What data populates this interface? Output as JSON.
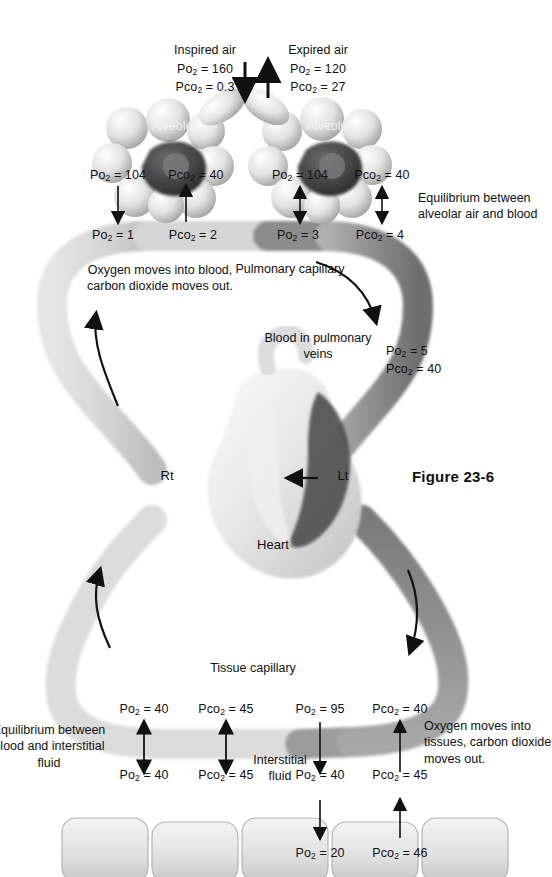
{
  "figure": {
    "caption": "Figure 23-6"
  },
  "air": {
    "inspired": {
      "label": "Inspired air",
      "po2": "Po2 = 160",
      "pco2": "Pco2 = 0.3"
    },
    "expired": {
      "label": "Expired air",
      "po2": "Po2 = 120",
      "pco2": "Pco2 = 27"
    }
  },
  "alveoli": {
    "left": {
      "name": "Alveolus",
      "po2": "Po2 = 104",
      "pco2": "Pco2 = 40"
    },
    "right": {
      "name": "Alveolus",
      "po2": "Po2 = 104",
      "pco2": "Pco2 = 40"
    }
  },
  "pulmonary_blood": {
    "left_po2": "Po2 = 1",
    "left_pco2": "Pco2 = 2",
    "right_po2": "Po2 = 3",
    "right_pco2": "Pco2 = 4",
    "capillary_label": "Pulmonary capillary",
    "note_left": "Oxygen moves into blood, carbon dioxide moves out.",
    "note_right": "Equilibrium between alveolar air and blood",
    "veins_label": "Blood in pulmonary veins",
    "veins_po2": "Po2 = 5",
    "veins_pco2": "Pco2 = 40"
  },
  "heart": {
    "right_label": "Rt",
    "left_label": "Lt",
    "name": "Heart"
  },
  "tissue": {
    "capillary_label": "Tissue capillary",
    "blood_in_po2": "Po2 = 95",
    "blood_in_pco2": "Pco2 = 40",
    "blood_out_po2": "Po2 = 40",
    "blood_out_pco2": "Pco2 = 45",
    "interstitial_label": "Interstitial fluid",
    "if_left_po2": "Po2 = 40",
    "if_left_pco2": "Pco2 = 45",
    "if_right_po2": "Po2 = 40",
    "if_right_pco2": "Pco2 = 45",
    "cells_po2": "Po2 = 20",
    "cells_pco2": "Pco2 = 46",
    "note_left": "Equilibrium between blood and interstitial fluid",
    "note_right": "Oxygen moves into tissues, carbon dioxide moves out."
  },
  "colors": {
    "oxygenated": "#d9d9d9",
    "deoxygenated": "#8f8f8f",
    "dark": "#4f4f4f",
    "ink": "#111111",
    "paper": "#ffffff"
  }
}
